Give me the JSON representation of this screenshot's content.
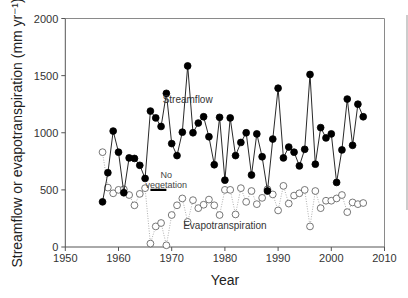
{
  "chart_data": {
    "type": "line",
    "title": "",
    "xlabel": "Year",
    "ylabel": "Streamflow or evapotranspiration (mm yr⁻¹)",
    "xlim": [
      1950,
      2010
    ],
    "ylim": [
      0,
      2000
    ],
    "xticks": [
      1950,
      1960,
      1970,
      1980,
      1990,
      2000,
      2010
    ],
    "yticks": [
      0,
      500,
      1000,
      1500,
      2000
    ],
    "grid": false,
    "legend": "none (inline text labels)",
    "x": [
      1957,
      1958,
      1959,
      1960,
      1961,
      1962,
      1963,
      1964,
      1965,
      1966,
      1967,
      1968,
      1969,
      1970,
      1971,
      1972,
      1973,
      1974,
      1975,
      1976,
      1977,
      1978,
      1979,
      1980,
      1981,
      1982,
      1983,
      1984,
      1985,
      1986,
      1987,
      1988,
      1989,
      1990,
      1991,
      1992,
      1993,
      1994,
      1995,
      1996,
      1997,
      1998,
      1999,
      2000,
      2001,
      2002,
      2003,
      2004,
      2005,
      2006
    ],
    "series": [
      {
        "name": "Streamflow",
        "marker": "filled-circle",
        "line": "solid",
        "color": "#000000",
        "values": [
          395,
          650,
          1015,
          830,
          475,
          780,
          775,
          715,
          600,
          1190,
          1130,
          1055,
          1345,
          905,
          800,
          1005,
          1585,
          1000,
          1085,
          1140,
          965,
          720,
          1135,
          585,
          1130,
          800,
          915,
          1000,
          630,
          990,
          790,
          490,
          945,
          1390,
          780,
          875,
          830,
          710,
          855,
          1510,
          725,
          1045,
          955,
          990,
          565,
          850,
          1295,
          890,
          1250,
          1140
        ]
      },
      {
        "name": "Evapotranspiration",
        "marker": "open-circle",
        "line": "dotted",
        "color": "#888888",
        "values": [
          830,
          520,
          470,
          500,
          505,
          455,
          365,
          465,
          515,
          30,
          180,
          210,
          15,
          280,
          365,
          425,
          220,
          410,
          340,
          370,
          415,
          365,
          280,
          500,
          500,
          285,
          515,
          395,
          490,
          375,
          430,
          505,
          460,
          320,
          535,
          380,
          450,
          470,
          500,
          180,
          490,
          340,
          405,
          405,
          425,
          455,
          305,
          390,
          375,
          385
        ]
      }
    ],
    "annotations": [
      {
        "text": "Streamflow",
        "x": 1973,
        "y": 1260
      },
      {
        "text": "Evapotranspiration",
        "x": 1980,
        "y": 160
      },
      {
        "text_lines": [
          "No",
          "vegetation"
        ],
        "x": 1969,
        "y": 600
      },
      {
        "type": "bar",
        "label": "no-vegetation-period",
        "x_start": 1966,
        "x_end": 1969,
        "y": 500
      }
    ]
  }
}
